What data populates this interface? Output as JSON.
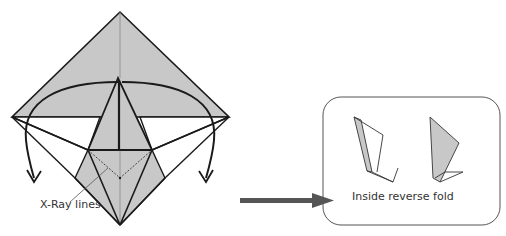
{
  "diagram": {
    "main_label": "X-Ray lines",
    "inset_label": "Inside reverse fold",
    "colors": {
      "paper_gray": "#c8c8c8",
      "line": "#1a1a1a",
      "arrow": "#555555",
      "inset_border": "#555555"
    }
  }
}
